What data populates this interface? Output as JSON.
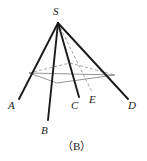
{
  "figure": {
    "caption": "（B）",
    "type": "solid-geometry-pyramid",
    "colors": {
      "stroke_solid": "#1a1a1a",
      "stroke_base": "#8a8a8a",
      "stroke_dashed": "#9a9a9a",
      "background": "#ffffff",
      "label": "#1a1a1a"
    },
    "labels": {
      "S": "S",
      "A": "A",
      "B": "B",
      "C": "C",
      "D": "D",
      "E": "E"
    },
    "points": {
      "S": [
        58,
        23
      ],
      "A": [
        19,
        99
      ],
      "B": [
        48,
        120
      ],
      "C": [
        79,
        97
      ],
      "D": [
        128,
        99
      ],
      "E": [
        92,
        92
      ],
      "base_left": [
        29,
        73
      ],
      "base_bottom": [
        57,
        83
      ],
      "base_right": [
        115,
        75
      ],
      "base_top": [
        70,
        63
      ]
    },
    "edges": [
      {
        "name": "SA",
        "from": "S",
        "to": "A",
        "style": "solid"
      },
      {
        "name": "SB",
        "from": "S",
        "to": "B",
        "style": "solid"
      },
      {
        "name": "SC",
        "from": "S",
        "to": "C",
        "style": "solid"
      },
      {
        "name": "SD",
        "from": "S",
        "to": "D",
        "style": "solid"
      },
      {
        "name": "SE",
        "from": "S",
        "to": "E",
        "style": "dashed"
      },
      {
        "name": "S-base-top",
        "from": "S",
        "to": "base_top",
        "style": "dashed"
      },
      {
        "name": "base-left-top",
        "from": "base_left",
        "to": "base_top",
        "style": "dashed"
      },
      {
        "name": "base-top-right",
        "from": "base_top",
        "to": "base_right",
        "style": "dashed"
      },
      {
        "name": "base-left-bottom",
        "from": "base_left",
        "to": "base_bottom",
        "style": "solid-light"
      },
      {
        "name": "base-bottom-right",
        "from": "base_bottom",
        "to": "base_right",
        "style": "solid-light"
      },
      {
        "name": "base-left-right-diagonal",
        "from": "base_left",
        "to": "base_right",
        "style": "solid-light"
      }
    ]
  }
}
